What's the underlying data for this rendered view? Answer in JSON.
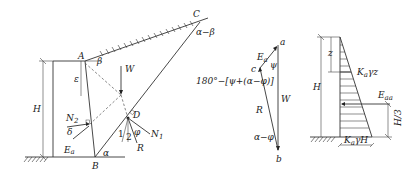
{
  "figure_left": {
    "title": "Coulomb active earth pressure wedge",
    "points": {
      "A": "A",
      "B": "B",
      "C": "C",
      "D": "D"
    },
    "labels": {
      "H": "H",
      "W": "W",
      "epsilon": "ε",
      "beta": "β",
      "alpha": "α",
      "alpha_minus_beta": "α−β",
      "N1": "N",
      "N1_sub": "1",
      "N2": "N",
      "N2_sub": "2",
      "delta": "δ",
      "Ea": "E",
      "Ea_sub": "a",
      "R": "R",
      "phi": "φ",
      "one": "1",
      "two": "2"
    }
  },
  "figure_middle": {
    "title": "Force polygon",
    "points": {
      "a": "a",
      "b": "b",
      "c": "c"
    },
    "labels": {
      "Ea": "E",
      "Ea_sub": "a",
      "psi": "ψ",
      "W": "W",
      "R": "R",
      "alpha_minus_phi": "α−φ",
      "angle_expr": "180°−[ψ+(α−φ)]"
    }
  },
  "figure_right": {
    "title": "Active earth pressure distribution",
    "labels": {
      "z": "z",
      "H": "H",
      "Kagz": "K",
      "Kagz_sub": "a",
      "Kagz_tail": "γz",
      "Eaa": "E",
      "Eaa_sub": "aa",
      "H3": "H/3",
      "KagH": "K",
      "KagH_sub": "a",
      "KagH_tail": "γH"
    }
  }
}
